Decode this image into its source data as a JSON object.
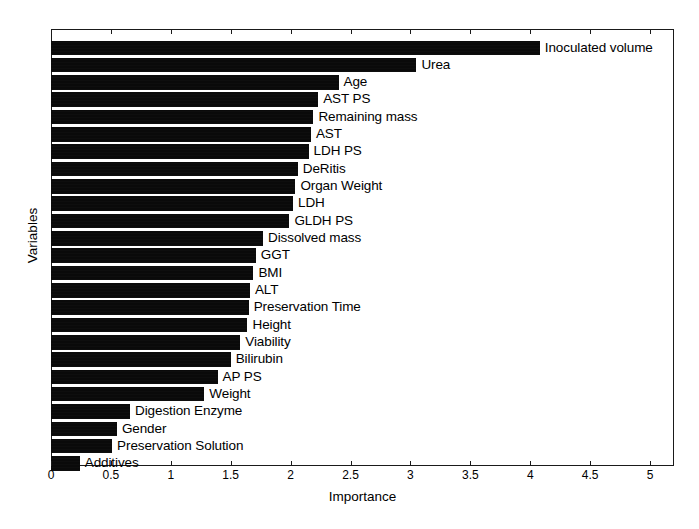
{
  "chart_data": {
    "type": "bar",
    "orientation": "horizontal",
    "title": "",
    "xlabel": "Importance",
    "ylabel": "Variables",
    "xlim": [
      0,
      5.2
    ],
    "xticks": [
      0,
      0.5,
      1,
      1.5,
      2,
      2.5,
      3,
      3.5,
      4,
      4.5,
      5
    ],
    "xtick_labels": [
      "0",
      "0.5",
      "1",
      "1.5",
      "2",
      "2.5",
      "3",
      "3.5",
      "4",
      "4.5",
      "5"
    ],
    "grid": false,
    "legend": "none",
    "bar_color": "#0a0a0a",
    "categories": [
      "Inoculated volume",
      "Urea",
      "Age",
      "AST PS",
      "Remaining mass",
      "AST",
      "LDH PS",
      "DeRitis",
      "Organ Weight",
      "LDH",
      "GLDH PS",
      "Dissolved mass",
      "GGT",
      "BMI",
      "ALT",
      "Preservation Time",
      "Height",
      "Viability",
      "Bilirubin",
      "AP PS",
      "Weight",
      "Digestion Enzyme",
      "Gender",
      "Preservation Solution",
      "Additives"
    ],
    "values": [
      4.08,
      3.05,
      2.4,
      2.23,
      2.19,
      2.17,
      2.15,
      2.06,
      2.04,
      2.02,
      1.99,
      1.77,
      1.71,
      1.69,
      1.66,
      1.65,
      1.64,
      1.58,
      1.5,
      1.39,
      1.28,
      0.66,
      0.55,
      0.51,
      0.24
    ]
  }
}
